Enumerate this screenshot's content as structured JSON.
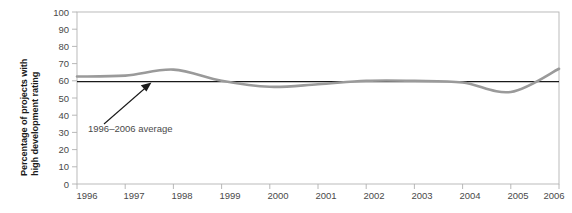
{
  "chart_data": {
    "type": "line",
    "title": "",
    "xlabel": "",
    "ylabel": "Percentage of projects with high development rating",
    "x": [
      1996,
      1997,
      1998,
      1999,
      2000,
      2001,
      2002,
      2003,
      2004,
      2005,
      2006
    ],
    "xtick_labels": [
      "1996",
      "1997",
      "1998",
      "1999",
      "2000",
      "2001",
      "2002",
      "2003",
      "2004",
      "2005",
      "2006"
    ],
    "ytick_labels": [
      "0",
      "10",
      "20",
      "30",
      "40",
      "50",
      "60",
      "70",
      "80",
      "90",
      "100"
    ],
    "ytick_values": [
      0,
      10,
      20,
      30,
      40,
      50,
      60,
      70,
      80,
      90,
      100
    ],
    "ylim": [
      0,
      100
    ],
    "xlim": [
      1996,
      2006
    ],
    "grid": false,
    "legend": "none",
    "series": [
      {
        "name": "Percentage of projects with high development rating",
        "color": "#9a9a9a",
        "values": [
          62.5,
          63.0,
          66.5,
          60.0,
          56.5,
          58.0,
          60.0,
          60.0,
          59.0,
          53.5,
          67.0
        ]
      }
    ],
    "reference_line": {
      "label": "1996–2006 average",
      "value": 59.5,
      "color": "#1a1a1a"
    },
    "annotations": [
      {
        "name": "average-annotation",
        "text": "1996–2006 average",
        "points_to": "reference-line"
      }
    ]
  },
  "colors": {
    "series_line": "#9a9a9a",
    "average_line": "#1a1a1a",
    "axis": "#b0b0b0",
    "tick_text": "#4a4a4a",
    "label_text": "#1a1a1a"
  }
}
